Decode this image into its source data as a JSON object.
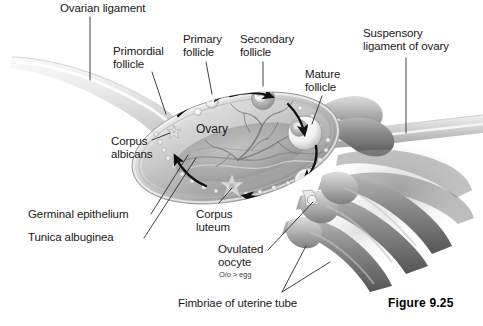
{
  "figure": {
    "number_label": "Figure 9.25",
    "title_present": false
  },
  "palette": {
    "background": "#ffffff",
    "text": "#191919",
    "leader_line": "#2b2b2b",
    "ligament_light": "#e9e9e9",
    "ovary_body_light": "#d8d8d8",
    "ovary_body_mid": "#b3b3b3",
    "ovary_body_dark": "#8f8f8f",
    "cortex_band": "#c9c9c9",
    "medulla": "#a8a8a8",
    "follicle_white": "#fdfdfd",
    "follicle_shadow": "#9a9a9a",
    "tube_gray": "#7d7d7d",
    "tube_dark": "#5c5c5c",
    "arrow_black": "#111111"
  },
  "labels": [
    {
      "id": "ovarian-ligament",
      "text": "Ovarian ligament",
      "x": 60,
      "y": 2,
      "align": "left"
    },
    {
      "id": "primordial-follicle",
      "text": "Primordial\nfollicle",
      "x": 113,
      "y": 45,
      "align": "left"
    },
    {
      "id": "primary-follicle",
      "text": "Primary\nfollicle",
      "x": 183,
      "y": 33,
      "align": "left"
    },
    {
      "id": "secondary-follicle",
      "text": "Secondary\nfollicle",
      "x": 240,
      "y": 33,
      "align": "left"
    },
    {
      "id": "mature-follicle",
      "text": "Mature\nfollicle",
      "x": 305,
      "y": 68,
      "align": "left"
    },
    {
      "id": "suspensory-ligament",
      "text": "Suspensory\nligament of ovary",
      "x": 363,
      "y": 27,
      "align": "left"
    },
    {
      "id": "corpus-albicans",
      "text": "Corpus\nalbicans",
      "x": 111,
      "y": 135,
      "align": "left"
    },
    {
      "id": "germinal-epithelium",
      "text": "Germinal epithelium",
      "x": 28,
      "y": 208,
      "align": "left"
    },
    {
      "id": "tunica-albuginea",
      "text": "Tunica albuginea",
      "x": 28,
      "y": 231,
      "align": "left"
    },
    {
      "id": "corpus-luteum",
      "text": "Corpus\nluteum",
      "x": 196,
      "y": 208,
      "align": "left"
    },
    {
      "id": "ovulated-oocyte",
      "text": "Ovulated\noocyte",
      "x": 218,
      "y": 243,
      "align": "left"
    },
    {
      "id": "fimbriae-uterine-tube",
      "text": "Fimbriae of uterine tube",
      "x": 178,
      "y": 297,
      "align": "left"
    }
  ],
  "inline_text": {
    "ovary": "Ovary",
    "oocyte_note": "O/o > egg"
  },
  "structures": [
    {
      "name": "ovarian-ligament",
      "kind": "tapering-tube",
      "description": "pale tube entering from upper-left, widening toward the ovary"
    },
    {
      "name": "ovary-body",
      "kind": "ellipsoid",
      "description": "large tilted ellipsoid cut open to show cortex and medulla"
    },
    {
      "name": "ovary-cortex-band",
      "kind": "band",
      "description": "outer ring of ovary carrying follicles"
    },
    {
      "name": "ovary-medulla",
      "kind": "inner-region",
      "description": "central region with branching blood vessels"
    },
    {
      "name": "germinal-epithelium",
      "kind": "surface-layer",
      "description": "outermost thin surface layer of the ovary"
    },
    {
      "name": "tunica-albuginea",
      "kind": "surface-layer",
      "description": "fibrous layer just deep to germinal epithelium"
    },
    {
      "name": "primordial-follicle",
      "kind": "follicle",
      "description": "tiny follicles at upper-left of cortex"
    },
    {
      "name": "primary-follicle",
      "kind": "follicle",
      "description": "small round follicle in upper cortex"
    },
    {
      "name": "secondary-follicle",
      "kind": "follicle",
      "description": "larger follicle with antrum, upper-right cortex"
    },
    {
      "name": "mature-follicle",
      "kind": "follicle",
      "description": "large vesicular follicle at right of cortex"
    },
    {
      "name": "ovulated-oocyte",
      "kind": "oocyte",
      "description": "oocyte leaving the ovary at lower-right"
    },
    {
      "name": "corpus-luteum",
      "kind": "star-body",
      "description": "star-shaped yellow body in lower cortex"
    },
    {
      "name": "corpus-albicans",
      "kind": "star-body",
      "description": "small scarred star body at left of cortex"
    },
    {
      "name": "suspensory-ligament",
      "kind": "tube",
      "description": "tube running to the right edge of the figure"
    },
    {
      "name": "fimbriae",
      "kind": "finger-projections",
      "description": "five dark finger-like projections of the uterine tube"
    },
    {
      "name": "cycle-arrows",
      "kind": "arrows",
      "description": "curved black arrows tracing the ovarian cycle clockwise"
    }
  ]
}
